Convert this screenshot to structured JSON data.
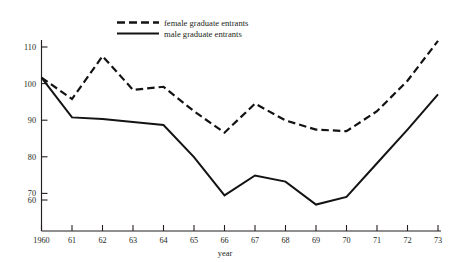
{
  "chart_data": {
    "type": "line",
    "title": "",
    "xlabel": "year",
    "ylabel": "",
    "x": [
      1960,
      1961,
      1962,
      1963,
      1964,
      1965,
      1966,
      1967,
      1968,
      1969,
      1970,
      1971,
      1972,
      1973
    ],
    "x_tick_labels": [
      "1960",
      "61",
      "62",
      "63",
      "64",
      "65",
      "66",
      "67",
      "68",
      "69",
      "70",
      "71",
      "72",
      "73"
    ],
    "y_tick_labels": [
      "110",
      "100",
      "90",
      "80",
      "70",
      "60"
    ],
    "y_ticks": [
      110,
      100,
      90,
      80,
      70,
      60
    ],
    "xlim": [
      1960,
      1973
    ],
    "ylim": [
      55,
      114
    ],
    "grid": false,
    "legend_position": "top-center",
    "series": [
      {
        "name": "female graduate entrants",
        "style": "dashed",
        "color": "#131313",
        "values": [
          100,
          93,
          107,
          96,
          97,
          89,
          82,
          91.5,
          86,
          83,
          82.5,
          89,
          99,
          112
        ]
      },
      {
        "name": "male graduate entrants",
        "style": "solid",
        "color": "#131313",
        "values": [
          100,
          87,
          86.5,
          85.5,
          84.5,
          74,
          61.5,
          68,
          66,
          58.5,
          61,
          72,
          83,
          94.5
        ]
      }
    ]
  },
  "legend": {
    "entries": [
      {
        "label": "female graduate entrants",
        "style": "dashed"
      },
      {
        "label": "male graduate entrants",
        "style": "solid"
      }
    ]
  },
  "axes": {
    "x_title": "year"
  }
}
